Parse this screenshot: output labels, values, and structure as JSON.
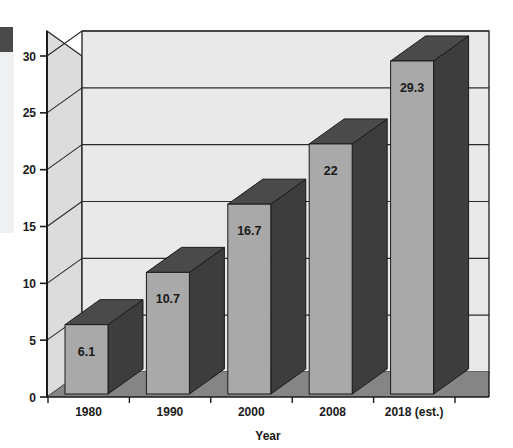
{
  "chart_data": {
    "type": "bar",
    "title": "",
    "subtitle": "",
    "xlabel": "Year",
    "ylabel": "",
    "categories": [
      "1980",
      "1990",
      "2000",
      "2008",
      "2018 (est.)"
    ],
    "values": [
      6.1,
      10.7,
      16.7,
      22,
      29.3
    ],
    "value_labels": [
      "6.1",
      "10.7",
      "16.7",
      "22",
      "29.3"
    ],
    "ylim": [
      0,
      30
    ],
    "yticks": [
      0,
      5,
      10,
      15,
      20,
      25,
      30
    ],
    "ytick_labels": [
      "0",
      "5",
      "10",
      "15",
      "20",
      "25",
      "30"
    ],
    "grid": true,
    "grid_axis": "y",
    "legend": false,
    "legend_position": "none",
    "style": "3d-column",
    "colors": {
      "bar_front": "#a9a9a9",
      "bar_side": "#3d3d3d",
      "bar_top": "#4a4a4a",
      "wall_back": "#e9e9e9",
      "wall_left": "#dcdcdc",
      "floor": "#858585",
      "floor_front": "#6f6f6f",
      "gridline": "#2b2b2b",
      "axis": "#1a1a1a",
      "text": "#1a1a1a",
      "margin_mark": "#4a4a4a",
      "margin_strip": "#eef0f1"
    }
  },
  "decorations": {
    "left_margin_block_label": "page-margin-block",
    "left_margin_strip_label": "page-margin-strip"
  }
}
